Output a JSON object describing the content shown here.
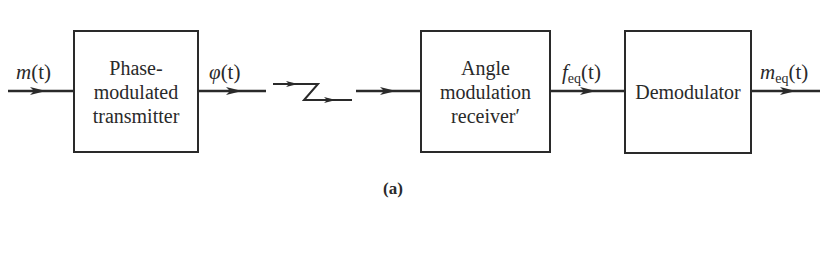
{
  "diagram": {
    "type": "block-diagram",
    "caption": "(a)",
    "blocks": [
      {
        "id": "tx",
        "label": "Phase-\nmodulated\ntransmitter"
      },
      {
        "id": "rx",
        "label": "Angle\nmodulation\nreceiver′"
      },
      {
        "id": "demod",
        "label": "Demodulator"
      }
    ],
    "signals": {
      "input": {
        "main": "m",
        "sub": "",
        "arg": "(t)"
      },
      "tx_out": {
        "main": "φ",
        "sub": "",
        "arg": "(t)"
      },
      "rx_out": {
        "main": "f",
        "sub": "eq",
        "arg": "(t)"
      },
      "output": {
        "main": "m",
        "sub": "eq",
        "arg": "(t)"
      }
    },
    "channel_symbol": "transmission-link",
    "colors": {
      "stroke": "#2a2a2a",
      "background": "#ffffff"
    }
  }
}
